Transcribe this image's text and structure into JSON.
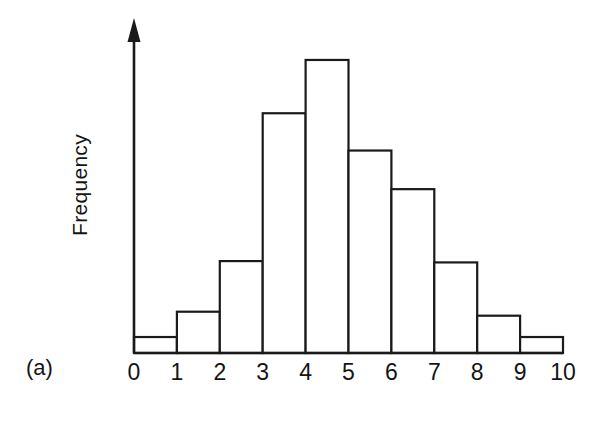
{
  "figure": {
    "panel_label": "(a)",
    "background_color": "#ffffff",
    "ink_color": "#1a1a1a"
  },
  "chart_data": {
    "type": "bar",
    "title": "",
    "subtitle": "",
    "xlabel": "",
    "ylabel": "Frequency",
    "categories": [
      "0-1",
      "1-2",
      "2-3",
      "3-4",
      "4-5",
      "5-6",
      "6-7",
      "7-8",
      "8-9",
      "9-10"
    ],
    "bin_edges": [
      0,
      1,
      2,
      3,
      4,
      5,
      6,
      7,
      8,
      9,
      10
    ],
    "x_tick_labels": [
      "0",
      "1",
      "2",
      "3",
      "4",
      "5",
      "6",
      "7",
      "8",
      "9",
      "10"
    ],
    "values": [
      12,
      31,
      69,
      180,
      220,
      152,
      123,
      68,
      28,
      12
    ],
    "xlim": [
      0,
      10
    ],
    "ylim": [
      0,
      250
    ],
    "y_axis_ticks_shown": false,
    "y_axis_has_arrow": true,
    "grid": false,
    "legend": null,
    "legend_position": "none",
    "bar_fill": "#ffffff",
    "bar_stroke": "#1a1a1a",
    "annotations": []
  },
  "geometry": {
    "plot_left_px": 134,
    "plot_right_px": 563,
    "baseline_y_px": 353,
    "axis_top_y_px": 20,
    "value_to_px_scale": 1.0
  }
}
